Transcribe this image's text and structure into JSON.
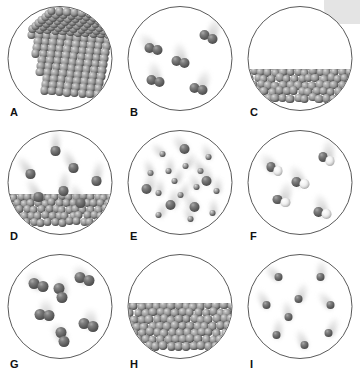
{
  "figure": {
    "title": "",
    "corner_shape_color": "#e4e4e4",
    "background": "#ffffff",
    "circle_border_color": "#5a5a5a",
    "sphere_colors": {
      "gray_atom": "#8d8d8d",
      "dark_atom": "#5a5a5a",
      "light_atom": "#f2f2f2",
      "motion_trail": "#bdbdbd"
    }
  },
  "panels": [
    {
      "label": "A",
      "name": "panel-a-crystalline-solid",
      "state": "solid",
      "description": "close-packed crystalline lattice of gray spheres filling the circle",
      "particle_type": "single atoms",
      "particle_count": "many",
      "has_motion_trails": false
    },
    {
      "label": "B",
      "name": "panel-b-diatomic-gas",
      "state": "gas",
      "description": "five dark diatomic molecules widely separated with motion blur trails",
      "particle_type": "diatomic molecules",
      "particle_count": "5",
      "has_motion_trails": true
    },
    {
      "label": "C",
      "name": "panel-c-liquid",
      "state": "liquid",
      "description": "gray spheres packed in the lower portion with a flat liquid surface, empty space above",
      "particle_type": "single atoms",
      "particle_count": "many",
      "has_motion_trails": false
    },
    {
      "label": "D",
      "name": "panel-d-liquid-vapor-equilibrium",
      "state": "liquid and vapor",
      "description": "liquid layer at the bottom with seven single atoms evaporating above it, each with a motion trail",
      "particle_type": "single atoms",
      "particle_count": "7 in vapor",
      "has_motion_trails": true
    },
    {
      "label": "E",
      "name": "panel-e-gas-mixture",
      "state": "gas",
      "description": "mixture of many small atoms and five larger atoms moving with motion trails",
      "particle_type": "single atoms of two sizes",
      "particle_count": "20",
      "has_motion_trails": true
    },
    {
      "label": "F",
      "name": "panel-f-heteronuclear-diatomic-gas",
      "state": "gas",
      "description": "five heteronuclear diatomic molecules, each one dark sphere bonded to one white sphere, with motion trails",
      "particle_type": "heteronuclear diatomic molecules",
      "particle_count": "5",
      "has_motion_trails": true
    },
    {
      "label": "G",
      "name": "panel-g-diatomic-gas",
      "state": "gas",
      "description": "six dark homonuclear diatomic molecules with motion trails",
      "particle_type": "diatomic molecules",
      "particle_count": "6",
      "has_motion_trails": true
    },
    {
      "label": "H",
      "name": "panel-h-liquid",
      "state": "liquid",
      "description": "densely packed gray spheres filling the lower half with a flat liquid surface",
      "particle_type": "single atoms",
      "particle_count": "many",
      "has_motion_trails": false
    },
    {
      "label": "I",
      "name": "panel-i-monatomic-gas",
      "state": "gas",
      "description": "nine single dark atoms spread through the circle with motion trails",
      "particle_type": "single atoms",
      "particle_count": "9",
      "has_motion_trails": true
    }
  ]
}
